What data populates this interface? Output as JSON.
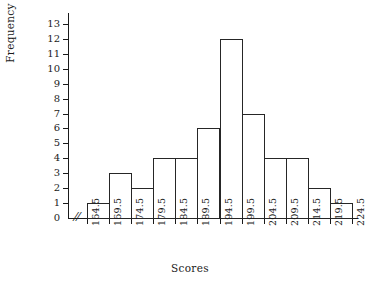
{
  "chart_data": {
    "type": "bar",
    "title": "",
    "subtitle": "",
    "xlabel": "Scores",
    "ylabel": "Frequency",
    "grid": false,
    "legend": null,
    "ylim": [
      0,
      13
    ],
    "ytick_labels": [
      "0",
      "1",
      "2",
      "3",
      "4",
      "5",
      "6",
      "7",
      "8",
      "9",
      "10",
      "11",
      "12",
      "13"
    ],
    "ytick_values": [
      0,
      1,
      2,
      3,
      4,
      5,
      6,
      7,
      8,
      9,
      10,
      11,
      12,
      13
    ],
    "xtick_labels": [
      "164.5",
      "169.5",
      "174.5",
      "179.5",
      "184.5",
      "189.5",
      "194.5",
      "199.5",
      "204.5",
      "209.5",
      "214.5",
      "219.5",
      "224.5"
    ],
    "xtick_values": [
      164.5,
      169.5,
      174.5,
      179.5,
      184.5,
      189.5,
      194.5,
      199.5,
      204.5,
      209.5,
      214.5,
      219.5,
      224.5
    ],
    "bin_edges": [
      164.5,
      169.5,
      174.5,
      179.5,
      184.5,
      189.5,
      194.5,
      199.5,
      204.5,
      209.5,
      214.5,
      219.5,
      224.5
    ],
    "bin_labels": [
      "164.5-169.5",
      "169.5-174.5",
      "174.5-179.5",
      "179.5-184.5",
      "184.5-189.5",
      "189.5-194.5",
      "194.5-199.5",
      "199.5-204.5",
      "204.5-209.5",
      "209.5-214.5",
      "214.5-219.5",
      "219.5-224.5"
    ],
    "values": [
      1,
      3,
      2,
      4,
      4,
      6,
      12,
      7,
      4,
      4,
      2,
      1
    ],
    "total_frequency": 50,
    "axis_break_x": true,
    "axis_break_glyph": "//",
    "bar_edge_color": "#262626",
    "bar_fill_color": "none",
    "axis_color": "#1a1a1a"
  }
}
